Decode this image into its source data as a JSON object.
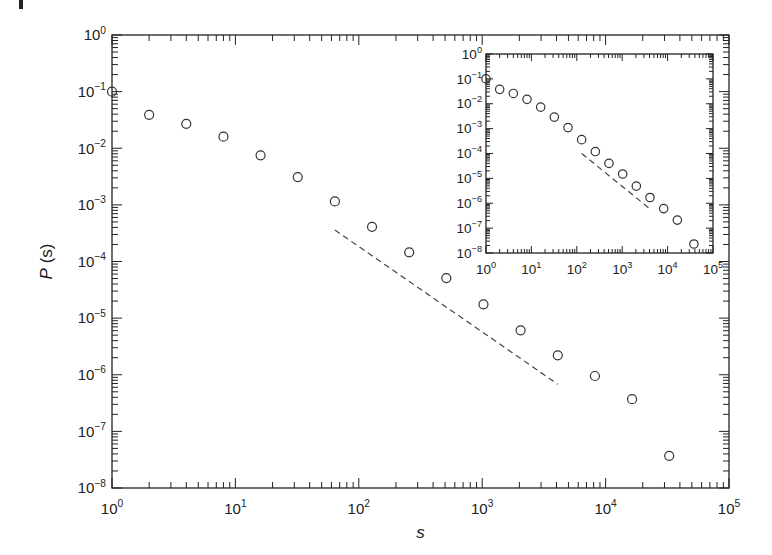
{
  "figure": {
    "corner_mark": "|",
    "colors": {
      "ink": "#222222",
      "marker": "#333333",
      "dash": "#444444",
      "background": "#ffffff"
    }
  },
  "chart_data": [
    {
      "id": "main",
      "type": "scatter",
      "title": "",
      "xlabel": "s",
      "ylabel": "P(s)",
      "xscale": "log",
      "yscale": "log",
      "xlim": [
        1,
        100000
      ],
      "ylim": [
        1e-08,
        1
      ],
      "grid": false,
      "legend": null,
      "x_tick_labels": [
        {
          "base": "10",
          "exp": "0",
          "value": 1
        },
        {
          "base": "10",
          "exp": "1",
          "value": 10
        },
        {
          "base": "10",
          "exp": "2",
          "value": 100
        },
        {
          "base": "10",
          "exp": "3",
          "value": 1000
        },
        {
          "base": "10",
          "exp": "4",
          "value": 10000
        },
        {
          "base": "10",
          "exp": "5",
          "value": 100000
        }
      ],
      "y_tick_labels": [
        {
          "base": "10",
          "exp": "0",
          "value": 1
        },
        {
          "base": "10",
          "exp": "−1",
          "value": 0.1
        },
        {
          "base": "10",
          "exp": "−2",
          "value": 0.01
        },
        {
          "base": "10",
          "exp": "−3",
          "value": 0.001
        },
        {
          "base": "10",
          "exp": "−4",
          "value": 0.0001
        },
        {
          "base": "10",
          "exp": "−5",
          "value": 1e-05
        },
        {
          "base": "10",
          "exp": "−6",
          "value": 1e-06
        },
        {
          "base": "10",
          "exp": "−7",
          "value": 1e-07
        },
        {
          "base": "10",
          "exp": "−8",
          "value": 1e-08
        }
      ],
      "series": [
        {
          "name": "P(s) data",
          "marker": "open-circle",
          "x": [
            1,
            2,
            4,
            8,
            16,
            32,
            64,
            128,
            256,
            512,
            1024,
            2048,
            4096,
            8192,
            16384,
            32768
          ],
          "y": [
            0.1,
            0.039,
            0.027,
            0.016,
            0.0075,
            0.0031,
            0.00115,
            0.00041,
            0.000145,
            5.1e-05,
            1.75e-05,
            6.1e-06,
            2.2e-06,
            9.5e-07,
            3.7e-07,
            3.7e-08
          ]
        }
      ],
      "annotations": [
        {
          "type": "dashed-line",
          "label": "power-law guide (slope ≈ −1.5)",
          "x": [
            64,
            4096
          ],
          "y": [
            0.00036,
            6.8e-07
          ]
        }
      ]
    },
    {
      "id": "inset",
      "type": "scatter",
      "title": "",
      "xlabel": "",
      "ylabel": "",
      "xscale": "log",
      "yscale": "log",
      "xlim": [
        1,
        100000
      ],
      "ylim": [
        1e-08,
        1
      ],
      "grid": false,
      "legend": null,
      "x_tick_labels": [
        {
          "base": "10",
          "exp": "0",
          "value": 1
        },
        {
          "base": "10",
          "exp": "1",
          "value": 10
        },
        {
          "base": "10",
          "exp": "2",
          "value": 100
        },
        {
          "base": "10",
          "exp": "3",
          "value": 1000
        },
        {
          "base": "10",
          "exp": "4",
          "value": 10000
        },
        {
          "base": "10",
          "exp": "5",
          "value": 100000
        }
      ],
      "y_tick_labels": [
        {
          "base": "10",
          "exp": "0",
          "value": 1
        },
        {
          "base": "10",
          "exp": "−1",
          "value": 0.1
        },
        {
          "base": "10",
          "exp": "−2",
          "value": 0.01
        },
        {
          "base": "10",
          "exp": "−3",
          "value": 0.001
        },
        {
          "base": "10",
          "exp": "−4",
          "value": 0.0001
        },
        {
          "base": "10",
          "exp": "−5",
          "value": 1e-05
        },
        {
          "base": "10",
          "exp": "−6",
          "value": 1e-06
        },
        {
          "base": "10",
          "exp": "−7",
          "value": 1e-07
        },
        {
          "base": "10",
          "exp": "−8",
          "value": 1e-08
        }
      ],
      "series": [
        {
          "name": "P(s) inset data",
          "marker": "open-circle",
          "x": [
            1,
            2,
            4,
            8,
            16,
            32,
            64,
            128,
            256,
            512,
            1024,
            2048,
            4096,
            8192,
            16384,
            38000
          ],
          "y": [
            0.1,
            0.038,
            0.026,
            0.015,
            0.0073,
            0.0029,
            0.0011,
            0.00036,
            0.00012,
            4e-05,
            1.5e-05,
            4.9e-06,
            1.7e-06,
            6.1e-07,
            2.1e-07,
            2.3e-08
          ]
        }
      ],
      "annotations": [
        {
          "type": "dashed-line",
          "label": "power-law guide",
          "x": [
            128,
            4096
          ],
          "y": [
            0.0001,
            5.9e-07
          ]
        }
      ]
    }
  ]
}
